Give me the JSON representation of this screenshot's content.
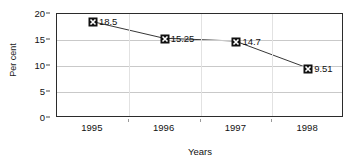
{
  "chart_data": {
    "type": "line",
    "title": "",
    "subtitle": "",
    "xlabel": "Years",
    "ylabel": "Per cent",
    "categories": [
      "1995",
      "1996",
      "1997",
      "1998"
    ],
    "values": [
      18.5,
      15.25,
      14.7,
      9.51
    ],
    "point_labels": [
      "18.5",
      "15.25",
      "14.7",
      "9.51"
    ],
    "series": [
      {
        "name": "",
        "values": [
          18.5,
          15.25,
          14.7,
          9.51
        ]
      }
    ],
    "ylim": [
      0,
      20
    ],
    "ytick_labels": [
      "0",
      "5",
      "10",
      "15",
      "20"
    ],
    "ytick_values": [
      0,
      5,
      10,
      15,
      20
    ],
    "xtick_labels": [
      "1995",
      "1996",
      "1997",
      "1998"
    ],
    "grid": "horizontal",
    "legend": "none",
    "marker": "x-in-filled-square",
    "colors": {
      "line": "#333333",
      "marker": "#111111",
      "marker_glyph": "#ffffff",
      "gridline": "#c9c9c9",
      "axis": "#2b2b2b",
      "text": "#111111",
      "background": "#ffffff"
    }
  }
}
